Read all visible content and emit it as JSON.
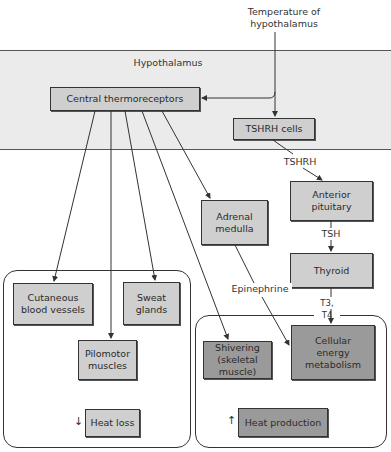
{
  "diagram": {
    "input_label": "Temperature of\nhypothalamus",
    "region_label": "Hypothalamus",
    "nodes": {
      "central_thermoreceptors": "Central thermoreceptors",
      "tshrh_cells": "TSHRH cells",
      "anterior_pituitary": "Anterior\npituitary",
      "adrenal_medulla": "Adrenal\nmedulla",
      "thyroid": "Thyroid",
      "cutaneous_blood_vessels": "Cutaneous\nblood vessels",
      "sweat_glands": "Sweat\nglands",
      "pilomotor_muscles": "Pilomotor\nmuscles",
      "heat_loss": "Heat loss",
      "shivering": "Shivering\n(skeletal\nmuscle)",
      "cellular_energy_metabolism": "Cellular\nenergy\nmetabolism",
      "heat_production": "Heat production"
    },
    "edge_labels": {
      "tshrh": "TSHRH",
      "tsh": "TSH",
      "epinephrine": "Epinephrine",
      "t3_t4": "T3, T4"
    },
    "direction_markers": {
      "heat_loss": "↓",
      "heat_production": "↑"
    },
    "colors": {
      "band": "#ebebeb",
      "box_light": "#cfcfcf",
      "box_dark": "#9a9a9a",
      "line": "#333333"
    }
  }
}
